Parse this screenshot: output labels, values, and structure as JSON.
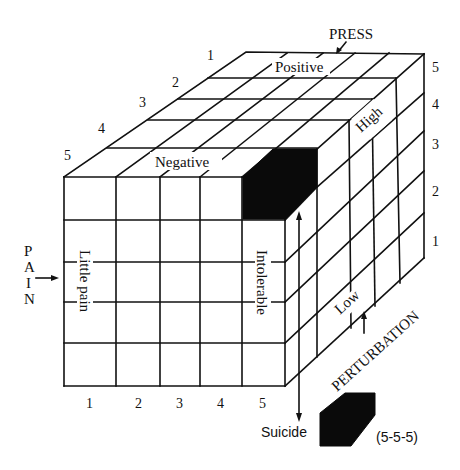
{
  "axes": {
    "press": {
      "title": "PRESS",
      "high_label": "Positive",
      "low_label": "Negative",
      "ticks": [
        "1",
        "2",
        "3",
        "4",
        "5"
      ]
    },
    "pain": {
      "title_letters": [
        "P",
        "A",
        "I",
        "N"
      ],
      "low_label": "Little pain",
      "high_label": "Intolerable",
      "ticks": [
        "1",
        "2",
        "3",
        "4",
        "5"
      ]
    },
    "perturbation": {
      "title": "PERTURBATION",
      "high_label": "High",
      "low_label": "Low",
      "ticks": [
        "5",
        "4",
        "3",
        "2",
        "1"
      ]
    }
  },
  "outcome": {
    "label": "Suicide",
    "coordinates": "(5-5-5)"
  },
  "colors": {
    "ink": "#111111",
    "fill": "#0a0a0a",
    "background": "#ffffff"
  }
}
